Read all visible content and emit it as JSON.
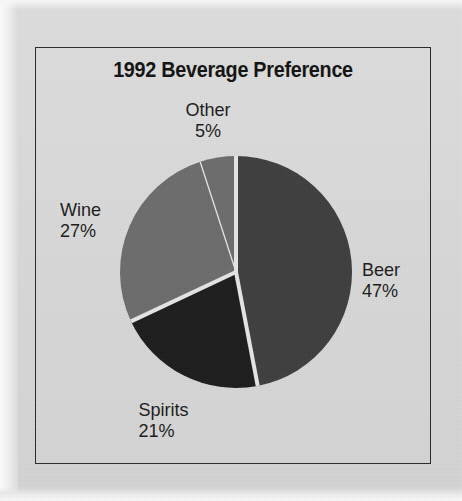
{
  "chart_data": {
    "type": "pie",
    "title": "1992 Beverage Preference",
    "categories": [
      "Beer",
      "Spirits",
      "Wine",
      "Other"
    ],
    "values": [
      47,
      21,
      27,
      5
    ],
    "value_unit": "%",
    "labels": [
      {
        "name": "Beer",
        "value": 47,
        "label": "Beer",
        "percent_text": "47%",
        "color": "#3f3f3f"
      },
      {
        "name": "Spirits",
        "value": 21,
        "label": "Spirits",
        "percent_text": "21%",
        "color": "#1d1d1d"
      },
      {
        "name": "Wine",
        "value": 27,
        "label": "Wine",
        "percent_text": "27%",
        "color": "#6d6d6d"
      },
      {
        "name": "Other",
        "value": 5,
        "label": "Other",
        "percent_text": "5%",
        "color": "#6d6d6d"
      }
    ],
    "start_angle_deg": 0,
    "direction": "clockwise",
    "legend": "none",
    "grid": false,
    "xlabel": "",
    "ylabel": ""
  },
  "chart": {
    "title": "1992 Beverage Preference",
    "slice_separator_color": "#e6e6e6",
    "frame_color": "#2a2a2a",
    "background_color": "#dadada",
    "label_color": "#1c1c1c",
    "geometry": {
      "center_x": 236,
      "center_y": 272,
      "radius": 116
    }
  },
  "labels": {
    "other": {
      "name": "Other",
      "percent": "5%"
    },
    "wine": {
      "name": "Wine",
      "percent": "27%"
    },
    "beer": {
      "name": "Beer",
      "percent": "47%"
    },
    "spirits": {
      "name": "Spirits",
      "percent": "21%"
    }
  }
}
